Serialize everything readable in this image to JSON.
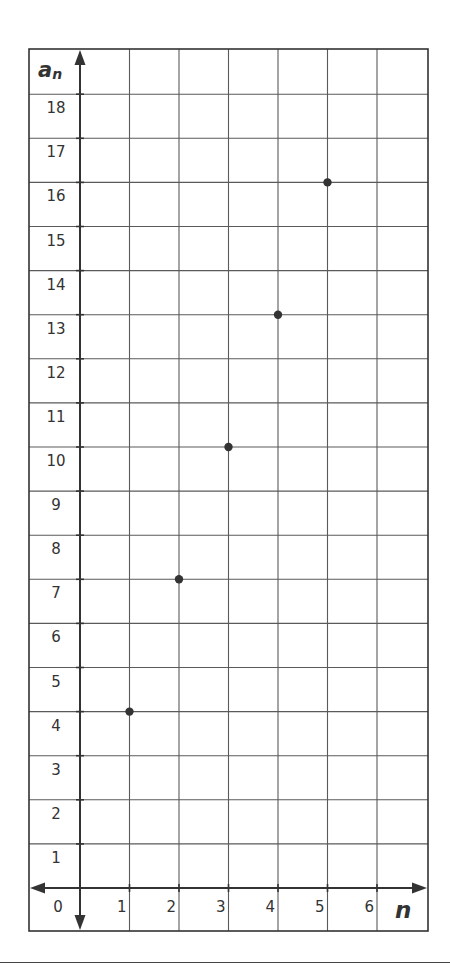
{
  "chart_data": {
    "type": "scatter",
    "title": "",
    "xlabel": "n",
    "ylabel": "a_n",
    "ylabel_display": {
      "main": "a",
      "sub": "n"
    },
    "x_ticks": [
      0,
      1,
      2,
      3,
      4,
      5,
      6
    ],
    "y_ticks": [
      1,
      2,
      3,
      4,
      5,
      6,
      7,
      8,
      9,
      10,
      11,
      12,
      13,
      14,
      15,
      16,
      17,
      18
    ],
    "xlim": [
      0,
      7
    ],
    "ylim": [
      0,
      19
    ],
    "grid": true,
    "legend": null,
    "points": [
      {
        "x": 1,
        "y": 4
      },
      {
        "x": 2,
        "y": 7
      },
      {
        "x": 3,
        "y": 10
      },
      {
        "x": 4,
        "y": 13
      },
      {
        "x": 5,
        "y": 16
      }
    ],
    "colors": {
      "grid": "#5a5a5a",
      "axis": "#333333",
      "point": "#333333",
      "text": "#333333"
    }
  }
}
